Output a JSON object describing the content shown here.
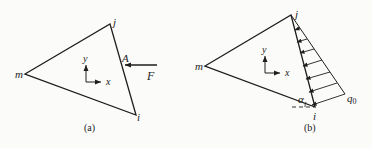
{
  "figure": {
    "panel_a": {
      "caption": "(a)",
      "nodes": {
        "m": "m",
        "j": "j",
        "i": "i"
      },
      "point_label": "A",
      "force_label": "F",
      "axes": {
        "x": "x",
        "y": "y"
      }
    },
    "panel_b": {
      "caption": "(b)",
      "nodes": {
        "m": "m",
        "j": "j",
        "i": "i"
      },
      "angle_label": "α",
      "load_label": "q",
      "load_subscript": "0",
      "axes": {
        "x": "x",
        "y": "y"
      },
      "distributed_load_arrow_count": 7
    },
    "colors": {
      "line": "#1e1e1e",
      "background": "#fbfbfa"
    }
  }
}
